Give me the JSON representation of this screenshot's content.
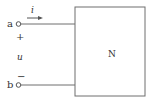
{
  "diagram": {
    "type": "circuit-one-port",
    "terminals": [
      {
        "name": "a",
        "label": "a",
        "polarity": "+"
      },
      {
        "name": "b",
        "label": "b",
        "polarity": "−"
      }
    ],
    "current_label": "i",
    "voltage_label": "u",
    "plus_sign": "+",
    "minus_sign": "−",
    "network_label": "N",
    "colors": {
      "line": "#6e6e6e",
      "text": "#333333",
      "background": "#ffffff"
    }
  }
}
